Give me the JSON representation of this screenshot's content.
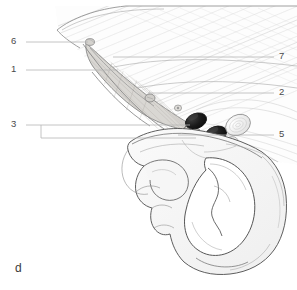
{
  "figure": {
    "panel_letter": "d",
    "background_color": "#ffffff",
    "leader_line_color": "#b5b5b5",
    "label_text_color": "#4a4a4a",
    "outline_color": "#5a5a5a",
    "vessel_dark_color": "#1c1c1c",
    "muscle_hatch_color": "#c9c9c9",
    "bone_fill_color": "#f4f4f4",
    "ligament_fill_color": "#d8d6d2"
  },
  "labels": {
    "left": [
      {
        "id": "label-6",
        "text": "6",
        "x": 11,
        "y": 38,
        "leader_x1": 26,
        "leader_y1": 42,
        "leader_x2": 88,
        "leader_y2": 42
      },
      {
        "id": "label-1",
        "text": "1",
        "x": 11,
        "y": 66,
        "leader_x1": 26,
        "leader_y1": 70,
        "leader_x2": 118,
        "leader_y2": 70
      },
      {
        "id": "label-3",
        "text": "3",
        "x": 11,
        "y": 121,
        "leader_x1": 26,
        "leader_y1": 125,
        "leader_x2": 190,
        "leader_y2": 125
      }
    ],
    "right": [
      {
        "id": "label-7",
        "text": "7",
        "x": 279,
        "y": 53,
        "leader_x1": 274,
        "leader_y1": 57,
        "leader_x2": 113,
        "leader_y2": 57
      },
      {
        "id": "label-2",
        "text": "2",
        "x": 279,
        "y": 89,
        "leader_x1": 274,
        "leader_y1": 93,
        "leader_x2": 148,
        "leader_y2": 93
      },
      {
        "id": "label-5",
        "text": "5",
        "x": 279,
        "y": 131,
        "leader_x1": 274,
        "leader_y1": 135,
        "leader_x2": 178,
        "leader_y2": 135
      }
    ],
    "bracket_3": {
      "vertical_x": 41,
      "vertical_y1": 125,
      "vertical_y2": 138,
      "branch_x2": 196,
      "branch_y": 138
    }
  },
  "illustration": {
    "title": "anatomical-line-drawing-hip-inguinal-region",
    "regions": [
      {
        "name": "abdominal-muscle-fascia-hatching",
        "description": "diagonal fiber hatching upper right"
      },
      {
        "name": "inguinal-ligament-band",
        "description": "shaded elongated band running upper-left to center"
      },
      {
        "name": "femoral-vessels",
        "description": "two dark oval vessel cross-sections"
      },
      {
        "name": "lymph-node",
        "description": "small pale oval lateral to vessels"
      },
      {
        "name": "hip-bone-ilium-pubis",
        "description": "pale bone outline lower center-right"
      },
      {
        "name": "obturator-foramen",
        "description": "large opening in hip bone"
      }
    ]
  }
}
